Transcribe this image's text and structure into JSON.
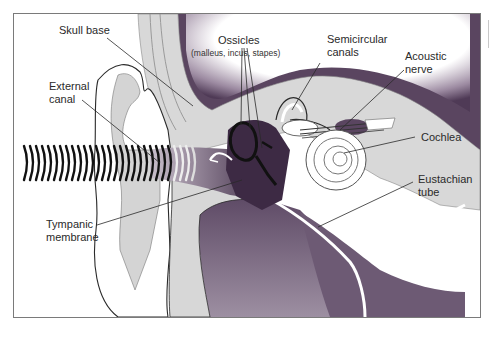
{
  "figure": {
    "colors": {
      "tissue_dark": "#4a3550",
      "tissue_mid": "#7d6a84",
      "tissue_light": "#b7aab9",
      "bone": "#d9d9d9",
      "outline": "#2a2a2a",
      "frame": "#7a7a7a"
    },
    "labels": {
      "skull_base": "Skull base",
      "external_canal_1": "External",
      "external_canal_2": "canal",
      "ossicles": "Ossicles",
      "ossicles_detail": "(malleus, incus, stapes)",
      "semicircular_1": "Semicircular",
      "semicircular_2": "canals",
      "acoustic_1": "Acoustic",
      "acoustic_2": "nerve",
      "cochlea": "Cochlea",
      "eustachian_1": "Eustachian",
      "eustachian_2": "tube",
      "tympanic_1": "Tympanic",
      "tympanic_2": "membrane"
    }
  }
}
